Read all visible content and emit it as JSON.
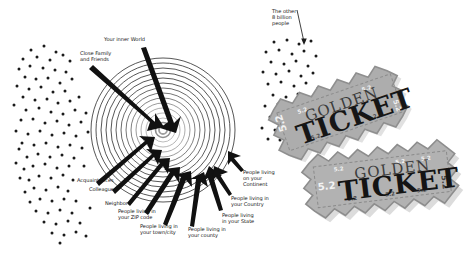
{
  "diagram": {
    "background_color": "#ffffff",
    "ink_color": "#151515",
    "dot_color": "#1a1a1a",
    "ticket_color": "#a9a9a9",
    "circle_center": {
      "x": 163,
      "y": 130
    },
    "ring_count": 14,
    "outer_radius": 72,
    "labels": [
      {
        "id": "inner-world",
        "text": "Your inner World",
        "x": 104,
        "y": 36,
        "align": "left"
      },
      {
        "id": "close-family",
        "text": "Close Family\nand Friends",
        "x": 80,
        "y": 50,
        "align": "left"
      },
      {
        "id": "acquaintances",
        "text": "Acquaintances",
        "x": 77,
        "y": 177,
        "align": "left"
      },
      {
        "id": "colleagues",
        "text": "Colleagues",
        "x": 89,
        "y": 186,
        "align": "left"
      },
      {
        "id": "neighbors",
        "text": "Neighbors",
        "x": 105,
        "y": 200,
        "align": "left"
      },
      {
        "id": "zip-code",
        "text": "People living in\nyour ZIP code",
        "x": 118,
        "y": 208,
        "align": "left"
      },
      {
        "id": "town-city",
        "text": "People living in\nyour town/city",
        "x": 140,
        "y": 223,
        "align": "left"
      },
      {
        "id": "county",
        "text": "People living in\nyour county",
        "x": 188,
        "y": 226,
        "align": "left"
      },
      {
        "id": "state",
        "text": "People living\nin your State",
        "x": 222,
        "y": 212,
        "align": "left"
      },
      {
        "id": "country",
        "text": "People living in\nyour Country",
        "x": 231,
        "y": 195,
        "align": "left"
      },
      {
        "id": "continent",
        "text": "People living\non your\nContinent",
        "x": 243,
        "y": 169,
        "align": "left"
      },
      {
        "id": "other-people",
        "text": "The other\n8 billion\npeople",
        "x": 272,
        "y": 8,
        "align": "left"
      }
    ],
    "tickets": [
      {
        "id": "ticket-top",
        "word_small": "GOLDEN",
        "word_large": "TICKET",
        "serial": "5.2"
      },
      {
        "id": "ticket-bottom",
        "word_small": "GOLDEN",
        "word_large": "TICKET",
        "serial": "5.2"
      }
    ],
    "dot_clusters": [
      {
        "id": "left-crowd",
        "count": 96
      },
      {
        "id": "right-crowd",
        "count": 44
      }
    ]
  }
}
